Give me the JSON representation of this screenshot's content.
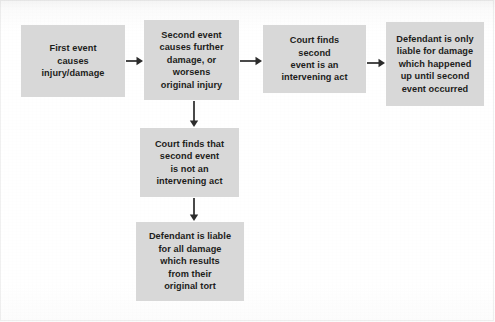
{
  "diagram": {
    "background_color": "#ffffff",
    "node_fill_color": "#d8d8d8",
    "node_text_color": "#1d1d1b",
    "arrow_color": "#2b2b2b",
    "nodes": [
      {
        "id": "first-event",
        "text": "First event\ncauses\ninjury/damage",
        "x": 21,
        "y": 25,
        "w": 104,
        "h": 72
      },
      {
        "id": "second-event",
        "text": "Second event\ncauses further\ndamage, or\nworsens\noriginal injury",
        "x": 144,
        "y": 20,
        "w": 95,
        "h": 80
      },
      {
        "id": "court-finds-intervening",
        "text": "Court finds\nsecond\nevent is an\nintervening act",
        "x": 263,
        "y": 25,
        "w": 103,
        "h": 68
      },
      {
        "id": "defendant-only-liable",
        "text": "Defendant is only\nliable for damage\nwhich happened\nup until second\nevent occurred",
        "x": 386,
        "y": 22,
        "w": 98,
        "h": 84
      },
      {
        "id": "court-finds-not-intervening",
        "text": "Court finds that\nsecond event\nis not an\nintervening act",
        "x": 140,
        "y": 128,
        "w": 99,
        "h": 69
      },
      {
        "id": "defendant-liable-all",
        "text": "Defendant is liable\nfor all damage\nwhich results\nfrom their\noriginal tort",
        "x": 136,
        "y": 222,
        "w": 108,
        "h": 79
      }
    ],
    "arrows": [
      {
        "id": "arrow-first-to-second",
        "direction": "right",
        "x": 126,
        "y": 55,
        "length": 17
      },
      {
        "id": "arrow-second-to-court-intervening",
        "direction": "right",
        "x": 240,
        "y": 55,
        "length": 22
      },
      {
        "id": "arrow-court-to-defendant-only",
        "direction": "right",
        "x": 367,
        "y": 57,
        "length": 18
      },
      {
        "id": "arrow-second-to-court-not-intervening",
        "direction": "down",
        "x": 188,
        "y": 101,
        "length": 26
      },
      {
        "id": "arrow-court-not-to-defendant-liable",
        "direction": "down",
        "x": 188,
        "y": 198,
        "length": 23
      }
    ]
  }
}
